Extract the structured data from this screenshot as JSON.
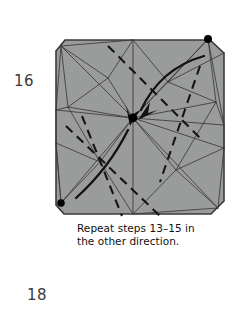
{
  "page": {
    "background_color": "#ffffff",
    "step_number": "16",
    "page_number": "18"
  },
  "caption": {
    "line1": "Repeat steps 13–15 in",
    "line2": "the other direction."
  },
  "diagram": {
    "name": "origami-crease-pattern",
    "paper_fill_color": "#9a9b9b",
    "paper_outline_color": "#3c3c3c",
    "crease_line_color": "#3a3a3a",
    "fold_dash_color": "#1a1a1a",
    "arrow_color": "#111111",
    "dot_color": "#000000",
    "shape": "square-with-cut-corners",
    "vertex_dots": [
      {
        "name": "dot-top-right",
        "cx": 160,
        "cy": 9
      },
      {
        "name": "dot-center",
        "cx": 85,
        "cy": 88
      },
      {
        "name": "dot-bottom-left",
        "cx": 13,
        "cy": 173
      }
    ],
    "arrows": [
      {
        "name": "arrow-upper-right-to-center",
        "direction": "down-left"
      },
      {
        "name": "arrow-lower-left-to-center",
        "direction": "up-right"
      }
    ],
    "fold_instruction": "valley and mountain folds converging on center"
  }
}
